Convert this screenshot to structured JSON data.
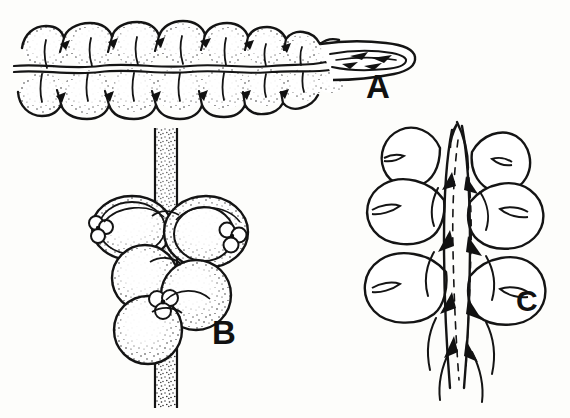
{
  "plate": {
    "background_color": "#fdfdfb",
    "ink_color": "#111111",
    "width": 570,
    "height": 418,
    "medium": "black ink line drawing with stipple shading",
    "subject": "botanical scientific illustration of leafy shoots"
  },
  "panels": [
    {
      "id": "A",
      "label": "A",
      "description": "Elongated leafy shoot seen in flattened dorsal view, running horizontally and tapering to a narrow pointed apex at the right; two ranks of overlapping rounded leaves above and below a wavy central axis; leaf surfaces stipple shaded",
      "orientation": "horizontal",
      "shading": "stippled",
      "leaf_pairs": 8,
      "label_position": {
        "x": 366,
        "y": 70
      }
    },
    {
      "id": "B",
      "label": "B",
      "description": "Vertical stippled stem bearing two tiers of large overlapping rounded leaves with small three-lobed underleaves at the leaf bases; stem continues below the leaves",
      "orientation": "vertical",
      "shading": "stippled",
      "leaf_tiers": 2,
      "label_position": {
        "x": 212,
        "y": 316
      }
    },
    {
      "id": "C",
      "label": "C",
      "description": "Vertical shoot drawn in outline only without stipple; slender central axis with dark wedge-shaped scales and dashed lines, flanked by three tiers of broad rounded notched leaves",
      "orientation": "vertical",
      "shading": "outline only",
      "leaf_tiers": 3,
      "label_position": {
        "x": 516,
        "y": 286
      }
    }
  ],
  "labels": {
    "a": "A",
    "b": "B",
    "c": "C"
  }
}
